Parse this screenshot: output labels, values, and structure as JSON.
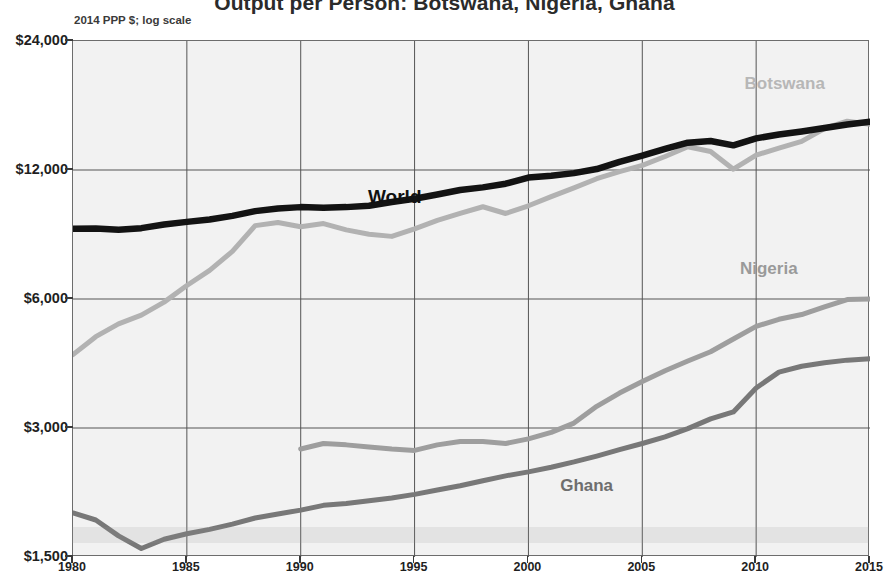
{
  "chart_data": {
    "type": "line",
    "title": "Output per Person: Botswana, Nigeria, Ghana",
    "subtitle": "2014 PPP $; log scale",
    "xlabel": "",
    "ylabel": "",
    "yscale": "log",
    "ylim": [
      1500,
      24000
    ],
    "xlim": [
      1980,
      2015
    ],
    "grid": true,
    "legend_position": "inline-labels",
    "ytick_labels": [
      "$24,000",
      "$12,000",
      "$6,000",
      "$3,000",
      "$1,500"
    ],
    "ytick_values": [
      24000,
      12000,
      6000,
      3000,
      1500
    ],
    "xtick_labels": [
      "1980",
      "1985",
      "1990",
      "1995",
      "2000",
      "2005",
      "2010",
      "2015"
    ],
    "xtick_values": [
      1980,
      1985,
      1990,
      1995,
      2000,
      2005,
      2010,
      2015
    ],
    "series": [
      {
        "name": "World",
        "color": "#131313",
        "width": 6.5,
        "label_x": 1993.0,
        "label_y": 10300,
        "x": [
          1980,
          1981,
          1982,
          1983,
          1984,
          1985,
          1986,
          1987,
          1988,
          1989,
          1990,
          1991,
          1992,
          1993,
          1994,
          1995,
          1996,
          1997,
          1998,
          1999,
          2000,
          2001,
          2002,
          2003,
          2004,
          2005,
          2006,
          2007,
          2008,
          2009,
          2010,
          2011,
          2012,
          2013,
          2014,
          2015
        ],
        "values": [
          8750,
          8760,
          8700,
          8780,
          8950,
          9080,
          9200,
          9380,
          9620,
          9760,
          9830,
          9800,
          9830,
          9900,
          10100,
          10280,
          10520,
          10780,
          10930,
          11150,
          11520,
          11640,
          11800,
          12060,
          12540,
          12960,
          13440,
          13900,
          14020,
          13700,
          14220,
          14520,
          14760,
          15040,
          15320,
          15560
        ]
      },
      {
        "name": "Botswana",
        "color": "#b2b2b2",
        "width": 5.0,
        "label_x": 2011.3,
        "label_y": 18900,
        "x": [
          1980,
          1981,
          1982,
          1983,
          1984,
          1985,
          1986,
          1987,
          1988,
          1989,
          1990,
          1991,
          1992,
          1993,
          1994,
          1995,
          1996,
          1997,
          1998,
          1999,
          2000,
          2001,
          2002,
          2003,
          2004,
          2005,
          2006,
          2007,
          2008,
          2009,
          2010,
          2011,
          2012,
          2013,
          2014,
          2015
        ],
        "values": [
          4450,
          4900,
          5250,
          5500,
          5900,
          6450,
          7000,
          7750,
          8900,
          9050,
          8850,
          9000,
          8700,
          8500,
          8400,
          8750,
          9150,
          9500,
          9850,
          9500,
          9900,
          10400,
          10900,
          11450,
          11900,
          12300,
          12900,
          13600,
          13250,
          12050,
          13000,
          13500,
          14000,
          15000,
          15600,
          15350
        ]
      },
      {
        "name": "Nigeria",
        "color": "#9e9e9e",
        "width": 5.0,
        "label_x": 2010.6,
        "label_y": 7000,
        "x": [
          1990,
          1991,
          1992,
          1993,
          1994,
          1995,
          1996,
          1997,
          1998,
          1999,
          2000,
          2001,
          2002,
          2003,
          2004,
          2005,
          2006,
          2007,
          2008,
          2009,
          2010,
          2011,
          2012,
          2013,
          2014,
          2015
        ],
        "values": [
          2680,
          2760,
          2740,
          2710,
          2680,
          2660,
          2740,
          2790,
          2790,
          2760,
          2830,
          2930,
          3080,
          3370,
          3620,
          3850,
          4080,
          4300,
          4520,
          4840,
          5180,
          5380,
          5520,
          5750,
          5980,
          6000
        ]
      },
      {
        "name": "Ghana",
        "color": "#787878",
        "width": 5.0,
        "label_x": 2002.6,
        "label_y": 2180,
        "x": [
          1980,
          1981,
          1982,
          1983,
          1984,
          1985,
          1986,
          1987,
          1988,
          1989,
          1990,
          1991,
          1992,
          1993,
          1994,
          1995,
          1996,
          1997,
          1998,
          1999,
          2000,
          2001,
          2002,
          2003,
          2004,
          2005,
          2006,
          2007,
          2008,
          2009,
          2010,
          2011,
          2012,
          2013,
          2014,
          2015
        ],
        "values": [
          1900,
          1830,
          1680,
          1570,
          1650,
          1700,
          1740,
          1790,
          1850,
          1890,
          1930,
          1980,
          2000,
          2030,
          2060,
          2100,
          2150,
          2200,
          2260,
          2320,
          2370,
          2430,
          2500,
          2580,
          2670,
          2760,
          2860,
          2990,
          3150,
          3270,
          3720,
          4050,
          4180,
          4260,
          4320,
          4350
        ]
      }
    ]
  },
  "axis": {
    "y_labels": [
      {
        "text": "$24,000",
        "value": 24000
      },
      {
        "text": "$12,000",
        "value": 12000
      },
      {
        "text": "$6,000",
        "value": 6000
      },
      {
        "text": "$3,000",
        "value": 3000
      },
      {
        "text": "$1,500",
        "value": 1500
      }
    ],
    "x_labels": [
      {
        "text": "1980",
        "value": 1980
      },
      {
        "text": "1985",
        "value": 1985
      },
      {
        "text": "1990",
        "value": 1990
      },
      {
        "text": "1995",
        "value": 1995
      },
      {
        "text": "2000",
        "value": 2000
      },
      {
        "text": "2005",
        "value": 2005
      },
      {
        "text": "2010",
        "value": 2010
      },
      {
        "text": "2015",
        "value": 2015
      }
    ]
  },
  "annotations": {
    "world": "World",
    "botswana": "Botswana",
    "nigeria": "Nigeria",
    "ghana": "Ghana"
  },
  "colors": {
    "world": "#131313",
    "botswana": "#b2b2b2",
    "nigeria": "#9e9e9e",
    "ghana": "#787878",
    "grid": "#555555",
    "frame": "#6d6d6d",
    "plot_bg": "#f2f2f2"
  }
}
